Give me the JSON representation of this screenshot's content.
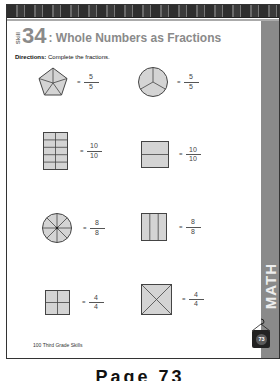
{
  "header": {
    "skill_word": "Skill",
    "skill_number": "34",
    "title": ": Whole Numbers as Fractions"
  },
  "directions": {
    "label": "Directions:",
    "text": " Complete the fractions."
  },
  "problems": [
    {
      "shape": "pentagon-5-parts",
      "equals": "=",
      "numerator": "5",
      "denominator": "5"
    },
    {
      "shape": "circle-3-parts",
      "equals": "=",
      "numerator": "5",
      "denominator": "5"
    },
    {
      "shape": "rectangle-2x5-grid",
      "equals": "=",
      "numerator": "10",
      "denominator": "10"
    },
    {
      "shape": "rectangle-2-rows",
      "equals": "=",
      "numerator": "10",
      "denominator": "10"
    },
    {
      "shape": "circle-8-parts",
      "equals": "=",
      "numerator": "8",
      "denominator": "8"
    },
    {
      "shape": "rectangle-3-columns",
      "equals": "=",
      "numerator": "8",
      "denominator": "8"
    },
    {
      "shape": "square-2x2-grid",
      "equals": "=",
      "numerator": "4",
      "denominator": "4"
    },
    {
      "shape": "square-diagonals",
      "equals": "=",
      "numerator": "4",
      "denominator": "4"
    }
  ],
  "side_tab": {
    "label": "MATH"
  },
  "footer": {
    "book_title": "100 Third Grade Skills",
    "page_badge": "73"
  },
  "caption": "Page 73",
  "colors": {
    "shape_fill": "#d4d4d4",
    "shape_stroke": "#444444",
    "title_gray": "#8a8a8a",
    "tab_gray": "#8a8a8a"
  }
}
